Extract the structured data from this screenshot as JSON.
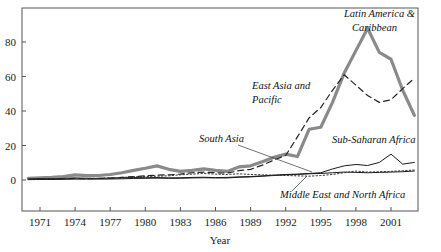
{
  "chart_data": {
    "type": "line",
    "title": "",
    "subtitle": "",
    "xlabel": "Year",
    "ylabel": "",
    "xlim": [
      1970,
      2003
    ],
    "ylim": [
      -10,
      95
    ],
    "grid": false,
    "legend_position": "inline-annotations",
    "xticks": [
      "1971",
      "1974",
      "1977",
      "1980",
      "1983",
      "1986",
      "1989",
      "1992",
      "1995",
      "1998",
      "2001"
    ],
    "xtick_values": [
      1971,
      1974,
      1977,
      1980,
      1983,
      1986,
      1989,
      1992,
      1995,
      1998,
      2001
    ],
    "yticks": [
      "0",
      "20",
      "40",
      "60",
      "80"
    ],
    "ytick_values": [
      0,
      20,
      40,
      60,
      80
    ],
    "x": [
      1970,
      1971,
      1972,
      1973,
      1974,
      1975,
      1976,
      1977,
      1978,
      1979,
      1980,
      1981,
      1982,
      1983,
      1984,
      1985,
      1986,
      1987,
      1988,
      1989,
      1990,
      1991,
      1992,
      1993,
      1994,
      1995,
      1996,
      1997,
      1998,
      1999,
      2000,
      2001,
      2002,
      2003
    ],
    "series": [
      {
        "name": "Latin America & Caribbean",
        "style": "thick-solid-gray",
        "color": "#8a8a8a",
        "width": 3.2,
        "values": [
          1.0,
          1.2,
          1.5,
          2.0,
          3.0,
          2.5,
          2.6,
          3.2,
          4.2,
          5.6,
          6.8,
          8.2,
          6.2,
          5.0,
          5.6,
          6.4,
          5.6,
          5.0,
          7.6,
          8.2,
          10.6,
          13.2,
          15.0,
          13.6,
          29.4,
          30.6,
          45.0,
          62.0,
          75.0,
          88.0,
          74.0,
          70.0,
          52.0,
          37.5
        ]
      },
      {
        "name": "East Asia and Pacific",
        "style": "dashed",
        "color": "#222222",
        "width": 1.2,
        "values": [
          0.3,
          0.4,
          0.5,
          0.7,
          0.9,
          0.8,
          0.9,
          1.1,
          1.5,
          2.0,
          2.4,
          2.8,
          3.0,
          3.4,
          4.2,
          4.6,
          4.2,
          4.0,
          5.4,
          6.2,
          8.6,
          11.6,
          14.2,
          25.0,
          36.0,
          42.0,
          52.0,
          61.0,
          55.0,
          49.0,
          45.0,
          46.5,
          53.0,
          59.0
        ]
      },
      {
        "name": "South Asia",
        "style": "thin-solid",
        "color": "#1a1a1a",
        "width": 1.0,
        "values": [
          0.2,
          0.3,
          0.3,
          0.4,
          0.5,
          0.5,
          0.5,
          0.6,
          0.7,
          0.9,
          1.0,
          1.1,
          1.0,
          1.0,
          1.2,
          1.3,
          1.2,
          1.2,
          1.6,
          1.8,
          2.2,
          2.6,
          3.0,
          3.2,
          3.6,
          3.8,
          4.2,
          4.6,
          4.4,
          4.2,
          4.4,
          4.6,
          4.8,
          5.2
        ]
      },
      {
        "name": "Sub-Saharan Africa",
        "style": "thin-solid",
        "color": "#1a1a1a",
        "width": 1.0,
        "values": [
          0.6,
          0.8,
          0.7,
          0.9,
          1.2,
          1.0,
          0.9,
          1.1,
          1.3,
          1.4,
          1.3,
          1.4,
          1.2,
          1.3,
          1.5,
          1.6,
          1.4,
          1.5,
          1.8,
          2.0,
          2.4,
          2.8,
          3.2,
          3.4,
          3.8,
          4.2,
          6.4,
          8.2,
          9.0,
          8.4,
          10.2,
          15.0,
          9.2,
          10.2
        ]
      },
      {
        "name": "Middle East and North Africa",
        "style": "dotted",
        "color": "#333333",
        "width": 1.0,
        "values": [
          0.4,
          0.5,
          0.6,
          0.8,
          1.0,
          0.9,
          1.0,
          1.2,
          1.5,
          1.8,
          2.0,
          2.2,
          2.4,
          3.0,
          3.4,
          3.8,
          3.4,
          3.2,
          3.6,
          3.2,
          3.0,
          2.8,
          2.6,
          2.4,
          2.2,
          2.6,
          3.2,
          4.2,
          5.2,
          4.6,
          4.8,
          5.0,
          5.4,
          5.8
        ]
      }
    ],
    "annotations": [
      {
        "text": "Latin America &",
        "x": 344,
        "y": 17
      },
      {
        "text": "Caribbean",
        "x": 352,
        "y": 31
      },
      {
        "text": "East Asia and",
        "x": 252,
        "y": 89
      },
      {
        "text": "Pacific",
        "x": 252,
        "y": 103
      },
      {
        "text": "South Asia",
        "x": 199,
        "y": 142
      },
      {
        "text": "Sub-Saharan Africa",
        "x": 332,
        "y": 143
      },
      {
        "text": "Middle East and North Africa",
        "x": 280,
        "y": 198
      }
    ]
  },
  "axis": {
    "x_title": "Year"
  }
}
